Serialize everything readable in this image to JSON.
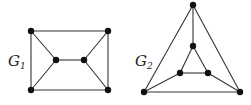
{
  "graphs": [
    {
      "label": "G",
      "subscript": "1",
      "label_pos": [
        8,
        66
      ],
      "nodes": [
        [
          31,
          31
        ],
        [
          108,
          31
        ],
        [
          31,
          90
        ],
        [
          108,
          90
        ],
        [
          56,
          60
        ],
        [
          84,
          60
        ]
      ],
      "edges": [
        [
          0,
          1
        ],
        [
          0,
          2
        ],
        [
          1,
          3
        ],
        [
          2,
          3
        ],
        [
          0,
          4
        ],
        [
          2,
          4
        ],
        [
          1,
          5
        ],
        [
          3,
          5
        ],
        [
          4,
          5
        ]
      ]
    },
    {
      "label": "G",
      "subscript": "2",
      "label_pos": [
        135,
        66
      ],
      "nodes": [
        [
          193,
          5
        ],
        [
          144,
          92
        ],
        [
          240,
          92
        ],
        [
          193,
          46
        ],
        [
          180,
          73
        ],
        [
          208,
          73
        ]
      ],
      "edges": [
        [
          0,
          1
        ],
        [
          0,
          2
        ],
        [
          1,
          2
        ],
        [
          0,
          3
        ],
        [
          3,
          4
        ],
        [
          3,
          5
        ],
        [
          4,
          5
        ],
        [
          1,
          4
        ],
        [
          2,
          5
        ]
      ]
    }
  ],
  "style": {
    "edge_color": "#333333",
    "node_color": "#111111",
    "node_radius": 3.2
  }
}
